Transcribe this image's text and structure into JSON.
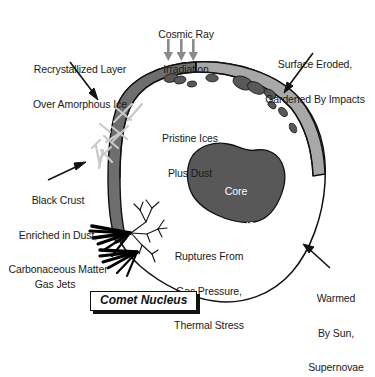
{
  "figure": {
    "title": "Comet Nucleus",
    "background_color": "#ffffff",
    "text_color": "#1a1a1a"
  },
  "colors": {
    "outline": "#111111",
    "dark_crust": "#6e6e6e",
    "light_crust": "#a8a8a8",
    "core_fill": "#585858",
    "crater_fill": "#4a4a4a",
    "crack_stroke": "#c9c9c9",
    "jet_black": "#000000",
    "arrow_gray": "#8a8a8a",
    "white_text": "#ffffff"
  },
  "labels": {
    "cosmic_ray": {
      "line1": "Cosmic Ray",
      "line2": "Irradiation"
    },
    "recrystallized": {
      "line1": "Recrystallized Layer",
      "line2": "Over Amorphous Ice"
    },
    "surface_eroded": {
      "line1": "Surface Eroded,",
      "line2": "Gardened By Impacts"
    },
    "pristine_ices": {
      "line1": "Pristine Ices",
      "line2": "Plus Dust"
    },
    "core": {
      "line1": "Core",
      "line2": "Melted?",
      "line3": "Recrystallized?"
    },
    "black_crust": {
      "line1": "Black Crust",
      "line2": "Enriched in Dust,",
      "line3": "Carbonaceous Matter"
    },
    "ruptures": {
      "line1": "Ruptures From",
      "line2": "Gas Pressure,",
      "line3": "Thermal Stress"
    },
    "gas_jets": {
      "line1": "Gas Jets"
    },
    "warmed": {
      "line1": "Warmed",
      "line2": "By Sun,",
      "line3": "Supernovae"
    }
  },
  "icons": {
    "cosmic_ray_arrows": "down-arrow-icon",
    "pointer_arrows": "pointer-arrow-icon",
    "gas_jet": "gas-jet-icon",
    "rupture_crack": "rupture-crack-icon",
    "crater": "crater-icon",
    "ice_crack": "ice-crack-icon"
  }
}
